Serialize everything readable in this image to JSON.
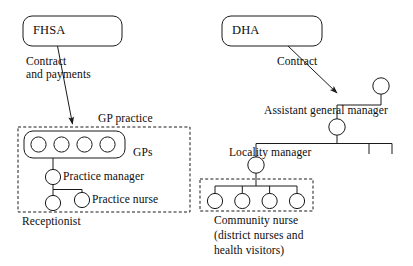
{
  "diagram": {
    "background_color": "#ffffff",
    "line_color": "#1a1a1a",
    "text_color": "#0d0d0d"
  },
  "boxes": [
    {
      "id": "fhsa",
      "label": "FHSA",
      "shape": "rounded-rectangle",
      "x": 23,
      "y": 16,
      "w": 99,
      "h": 30
    },
    {
      "id": "dha",
      "label": "DHA",
      "shape": "rounded-rectangle",
      "x": 222,
      "y": 16,
      "w": 100,
      "h": 30
    }
  ],
  "edges": [
    {
      "id": "fhsa-to-gp",
      "label": "Contract\nand payments",
      "label_line1": "Contract",
      "label_line2": "and payments",
      "from": "fhsa",
      "to": "gp-practice",
      "arrow": true
    },
    {
      "id": "dha-to-agm",
      "label": "Contract",
      "from": "dha",
      "to": "assistant-general-manager",
      "arrow": true
    }
  ],
  "groups": [
    {
      "id": "gp-practice",
      "label": "GP practice",
      "style": "dashed",
      "x": 18,
      "y": 127,
      "w": 172,
      "h": 85
    },
    {
      "id": "community-nurse-group",
      "label": "Community nurse\n(district nurses and\nhealth visitors)",
      "label_line1": "Community nurse",
      "label_line2": "(district nurses and",
      "label_line3": "health visitors)",
      "style": "dashed",
      "x": 200,
      "y": 179,
      "w": 113,
      "h": 32
    }
  ],
  "nodes": [
    {
      "id": "gps",
      "label": "GPs",
      "type": "grouped-circles",
      "count": 4
    },
    {
      "id": "practice-manager",
      "label": "Practice manager",
      "type": "circle"
    },
    {
      "id": "practice-nurse",
      "label": "Practice nurse",
      "type": "circle"
    },
    {
      "id": "receptionist",
      "label": "Receptionist",
      "type": "circle"
    },
    {
      "id": "assistant-general-manager",
      "label": "Assistant general manager",
      "type": "circle"
    },
    {
      "id": "locality-manager",
      "label": "Locality manager",
      "type": "circle"
    },
    {
      "id": "community-nurses",
      "label": "",
      "type": "circle-row",
      "count": 4
    }
  ]
}
